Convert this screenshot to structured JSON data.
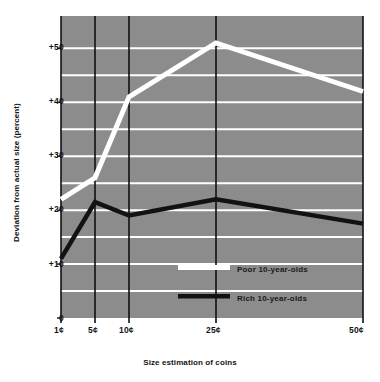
{
  "chart_data": {
    "type": "line",
    "title": "",
    "xlabel": "Size estimation of coins",
    "ylabel": "Deviation from actual size (percent)",
    "categories": [
      "1¢",
      "5¢",
      "10¢",
      "25¢",
      "50¢"
    ],
    "x_positions": [
      61,
      95,
      129,
      216,
      363
    ],
    "ylim": [
      0,
      56
    ],
    "yticks": [
      0,
      10,
      20,
      30,
      40,
      50
    ],
    "ytick_labels": [
      "0",
      "+10",
      "+20",
      "+30",
      "+40",
      "+50"
    ],
    "gridlines": [
      5,
      10,
      15,
      20,
      25,
      30,
      35,
      40,
      45,
      50
    ],
    "grid": true,
    "grid_color": "#ffffff",
    "plot_background": "#8c8c8c",
    "legend_position": "inside-center-lower",
    "series": [
      {
        "name": "Poor 10-year-olds",
        "color": "#ffffff",
        "values": [
          22,
          26,
          41,
          51,
          42
        ]
      },
      {
        "name": "Rich 10-year-olds",
        "color": "#121212",
        "values": [
          11,
          21.5,
          19,
          22,
          17.5
        ]
      }
    ]
  },
  "axis": {
    "ylabel": "Deviation from actual size (percent)",
    "xlabel": "Size estimation of coins",
    "ytick_labels": [
      "+50",
      "+40",
      "+30",
      "+20",
      "+10",
      "0"
    ],
    "xtick_labels": [
      "1¢",
      "5¢",
      "10¢",
      "25¢",
      "50¢"
    ]
  },
  "legend": {
    "items": [
      {
        "label": "Poor 10-year-olds",
        "color": "#ffffff"
      },
      {
        "label": "Rich 10-year-olds",
        "color": "#121212"
      }
    ]
  },
  "colors": {
    "plot_bg": "#8c8c8c",
    "grid": "#ffffff",
    "axis": "#111111",
    "poor_series": "#ffffff",
    "rich_series": "#121212",
    "text": "#141414"
  }
}
